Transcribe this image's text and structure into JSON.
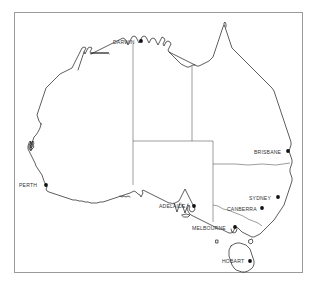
{
  "map": {
    "title": "Australia",
    "background_color": "#ffffff",
    "frame_color": "#9b9b9b",
    "coastline_color": "#1a1a1a",
    "border_color": "#5a5a5a",
    "city_marker_color": "#111111",
    "label_color": "#333333"
  },
  "cities": [
    {
      "name": "DARWIN",
      "label": "DARWIN",
      "label_x": 113,
      "label_y": 39,
      "dot_x": 141,
      "dot_y": 41
    },
    {
      "name": "BRISBANE",
      "label": "BRISBANE",
      "label_x": 254,
      "label_y": 149,
      "dot_x": 288,
      "dot_y": 151
    },
    {
      "name": "PERTH",
      "label": "PERTH",
      "label_x": 19,
      "label_y": 182,
      "dot_x": 46,
      "dot_y": 185
    },
    {
      "name": "SYDNEY",
      "label": "SYDNEY",
      "label_x": 249,
      "label_y": 195,
      "dot_x": 278,
      "dot_y": 197
    },
    {
      "name": "ADELAIDE",
      "label": "ADELAIDE",
      "label_x": 159,
      "label_y": 203,
      "dot_x": 194,
      "dot_y": 206
    },
    {
      "name": "CANBERRA",
      "label": "CANBERRA",
      "label_x": 227,
      "label_y": 206,
      "dot_x": 262,
      "dot_y": 208
    },
    {
      "name": "MELBOURNE",
      "label": "MELBOURNE",
      "label_x": 192,
      "label_y": 225,
      "dot_x": 235,
      "dot_y": 227
    },
    {
      "name": "HOBART",
      "label": "HOBART",
      "label_x": 222,
      "label_y": 258,
      "dot_x": 250,
      "dot_y": 261
    }
  ],
  "state_borders": [
    {
      "name": "wa-nt-border"
    },
    {
      "name": "nt-qld-border"
    },
    {
      "name": "nt-sa-border"
    },
    {
      "name": "wa-sa-border"
    },
    {
      "name": "sa-nsw-vic-border"
    },
    {
      "name": "qld-nsw-border"
    },
    {
      "name": "nsw-vic-border"
    }
  ]
}
